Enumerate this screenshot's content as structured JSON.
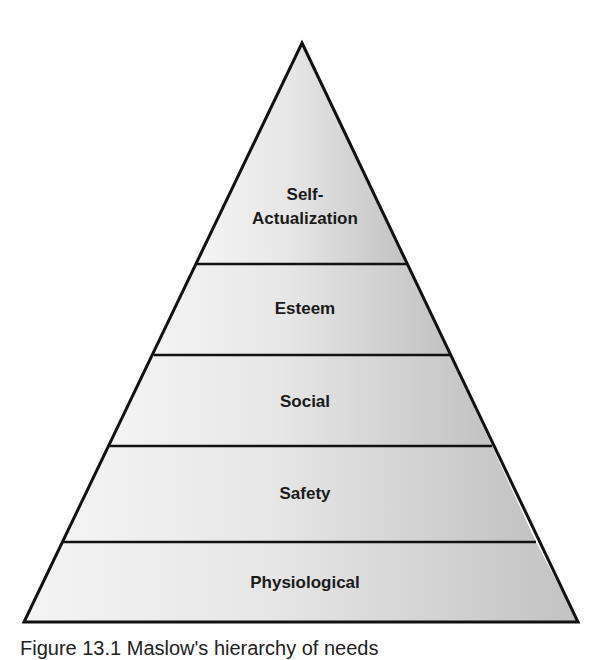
{
  "diagram": {
    "type": "pyramid",
    "levels": [
      {
        "label_lines": [
          "Self-",
          "Actualization"
        ],
        "name": "self-actualization"
      },
      {
        "label": "Esteem",
        "name": "esteem"
      },
      {
        "label": "Social",
        "name": "social"
      },
      {
        "label": "Safety",
        "name": "safety"
      },
      {
        "label": "Physiological",
        "name": "physiological"
      }
    ],
    "colors": {
      "fill_light": "#f4f4f4",
      "fill_dark": "#c2c2c2",
      "stroke": "#111111"
    }
  },
  "caption": "Figure 13.1 Maslow's hierarchy of needs"
}
